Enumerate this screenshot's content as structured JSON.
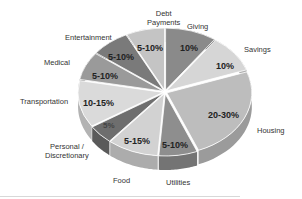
{
  "chart_data": {
    "type": "pie",
    "title": "",
    "style": "3d-exploded-pie",
    "start_angle_deg": 0,
    "direction": "clockwise",
    "slices": [
      {
        "name": "Giving",
        "label": "10%",
        "value": 10,
        "color": "#8a8a8a"
      },
      {
        "name": "Savings",
        "label": "10%",
        "value": 10,
        "color": "#d6d6d6"
      },
      {
        "name": "Housing",
        "label": "20-30%",
        "value": 25,
        "color": "#bdbdbd"
      },
      {
        "name": "Utilities",
        "label": "5-10%",
        "value": 7.5,
        "color": "#8e8e8e"
      },
      {
        "name": "Food",
        "label": "5-15%",
        "value": 10,
        "color": "#d2d2d2"
      },
      {
        "name": "Personal / Discretionary",
        "label": "5%",
        "value": 5,
        "color": "#6e6e6e"
      },
      {
        "name": "Transportation",
        "label": "10-15%",
        "value": 12.5,
        "color": "#dadada"
      },
      {
        "name": "Medical",
        "label": "5-10%",
        "value": 7.5,
        "color": "#9a9a9a"
      },
      {
        "name": "Entertainment",
        "label": "5-10%",
        "value": 7.5,
        "color": "#7a7a7a"
      },
      {
        "name": "Debt Payments",
        "label": "5-10%",
        "value": 7.5,
        "color": "#c4c4c4"
      }
    ]
  },
  "labels": {
    "giving": "Giving",
    "savings": "Savings",
    "housing": "Housing",
    "utilities": "Utilities",
    "food": "Food",
    "personal_1": "Personal /",
    "personal_2": "Discretionary",
    "transportation": "Transportation",
    "medical": "Medical",
    "entertainment": "Entertainment",
    "debt_1": "Debt",
    "debt_2": "Payments"
  },
  "percents": {
    "giving": "10%",
    "savings": "10%",
    "housing": "20-30%",
    "utilities": "5-10%",
    "food": "5-15%",
    "personal": "5%",
    "transportation": "10-15%",
    "medical": "5-10%",
    "entertainment": "5-10%",
    "debt": "5-10%"
  }
}
